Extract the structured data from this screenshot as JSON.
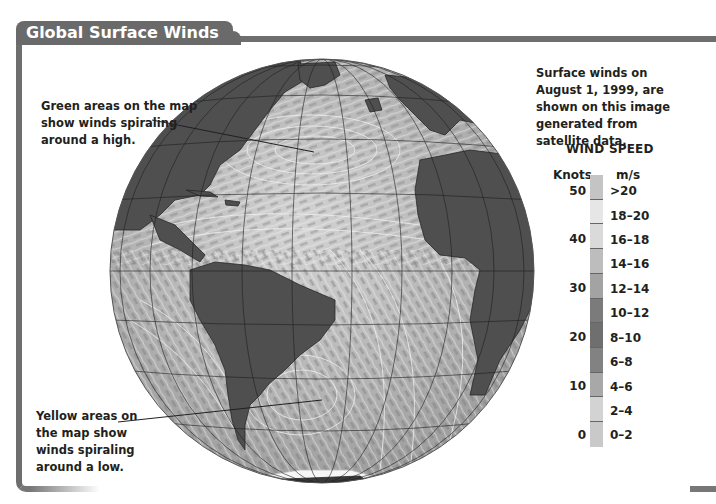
{
  "title": "Global Surface Winds",
  "description": "Surface winds on August 1, 1999, are shown on this image generated from satellite data.",
  "description_lines": [
    "Surface winds on August 1, 1999, are",
    "shown on this image generated from",
    "satellite data."
  ],
  "callouts": {
    "high": {
      "lines": [
        "Green areas on the map",
        "show winds spiraling",
        "around a high."
      ],
      "target": "North Atlantic high-pressure area"
    },
    "low": {
      "lines": [
        "Yellow areas on",
        "the map show",
        "winds spiraling",
        "around a low."
      ],
      "target": "South Atlantic low-pressure area"
    }
  },
  "legend": {
    "title": "WIND SPEED",
    "knots_header": "Knots",
    "ms_header": "m/s",
    "knots_ticks": [
      "50",
      "40",
      "30",
      "20",
      "10",
      "0"
    ],
    "bins": [
      {
        "label": ">20",
        "color": "#c4c4c4"
      },
      {
        "label": "18–20",
        "color": "#e6e6e6"
      },
      {
        "label": "16–18",
        "color": "#dadada"
      },
      {
        "label": "14–16",
        "color": "#bdbdbd"
      },
      {
        "label": "12–14",
        "color": "#a3a3a3"
      },
      {
        "label": "10–12",
        "color": "#7b7b7b"
      },
      {
        "label": "8–10",
        "color": "#6f6f6f"
      },
      {
        "label": "6–8",
        "color": "#828282"
      },
      {
        "label": "4–6",
        "color": "#a8a8a8"
      },
      {
        "label": "2–4",
        "color": "#d3d3d3"
      },
      {
        "label": "0–2",
        "color": "#c9c9c9"
      }
    ]
  },
  "colors": {
    "frame": "#6e6e6e",
    "land": "#4f4f4f",
    "ocean_light": "#c8c8c8",
    "ocean_dark": "#8a8a8a",
    "grid": "#1a1a1a"
  }
}
